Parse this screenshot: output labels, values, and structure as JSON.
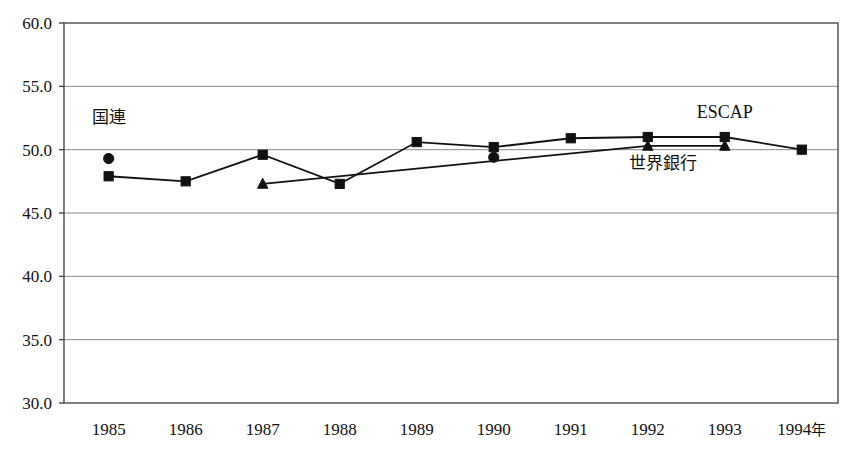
{
  "chart_data": {
    "type": "line",
    "title": "",
    "subtitle": "",
    "xlabel": "",
    "ylabel": "",
    "xlim": [
      1984.5,
      1994.6
    ],
    "ylim": [
      30.0,
      60.0
    ],
    "grid": true,
    "grid_axis": "y",
    "legend_position": "inline-annotation",
    "categories": [
      "1985",
      "1986",
      "1987",
      "1988",
      "1989",
      "1990",
      "1991",
      "1992",
      "1993",
      "1994"
    ],
    "x_tick_labels": [
      "1985",
      "1986",
      "1987",
      "1988",
      "1989",
      "1990",
      "1991",
      "1992",
      "1993",
      "1994年"
    ],
    "y_tick_labels": [
      "30.0",
      "35.0",
      "40.0",
      "45.0",
      "50.0",
      "55.0",
      "60.0"
    ],
    "y_ticks": [
      30.0,
      35.0,
      40.0,
      45.0,
      50.0,
      55.0,
      60.0
    ],
    "series": [
      {
        "name": "ESCAP",
        "marker": "square",
        "line": true,
        "x": [
          1985,
          1986,
          1987,
          1988,
          1989,
          1990,
          1991,
          1992,
          1993,
          1994
        ],
        "values": [
          47.9,
          47.5,
          49.6,
          47.3,
          50.6,
          50.2,
          50.9,
          51.0,
          51.0,
          50.0
        ]
      },
      {
        "name": "世界銀行",
        "marker": "triangle",
        "line": true,
        "x": [
          1987,
          1992,
          1993
        ],
        "values": [
          47.3,
          50.3,
          50.3
        ]
      },
      {
        "name": "国連",
        "marker": "circle",
        "line": false,
        "x": [
          1985,
          1990
        ],
        "values": [
          49.3,
          49.4
        ]
      }
    ],
    "annotations": [
      {
        "text": "国連",
        "x": 1985.0,
        "y": 52.1,
        "anchor": "middle"
      },
      {
        "text": "ESCAP",
        "x": 1993.0,
        "y": 52.5,
        "anchor": "middle"
      },
      {
        "text": "世界銀行",
        "x": 1992.2,
        "y": 48.5,
        "anchor": "middle"
      }
    ],
    "colors": {
      "line": "#111111",
      "marker": "#111111",
      "grid": "#8a8a8a",
      "axis": "#4a4a4a",
      "background": "#ffffff"
    }
  },
  "top_artifact": {
    "text": ""
  }
}
